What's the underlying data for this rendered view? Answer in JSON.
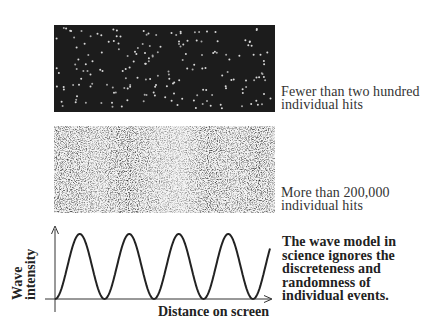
{
  "figure": {
    "panels": [
      {
        "id": "sparse",
        "caption_lines": [
          "Fewer than two hundred",
          "individual hits"
        ]
      },
      {
        "id": "dense",
        "caption_lines": [
          "More than 200,000",
          "individual hits"
        ]
      }
    ],
    "wave_plot": {
      "ylabel_lines": [
        "Wave",
        "intensity"
      ],
      "xlabel": "Distance on screen",
      "note_lines": [
        "The wave model in",
        "science ignores the",
        "discreteness and",
        "randomness of",
        "individual events."
      ]
    }
  },
  "chart_data": {
    "type": "line",
    "title": "",
    "xlabel": "Distance on screen",
    "ylabel": "Wave intensity",
    "peaks_x_px": [
      79,
      130,
      180,
      230
    ],
    "troughs_x_px": [
      55,
      104,
      154,
      204,
      253
    ],
    "grid": false
  },
  "colors": {
    "panel_dark": "#1c1c1c",
    "ink": "#222222"
  }
}
